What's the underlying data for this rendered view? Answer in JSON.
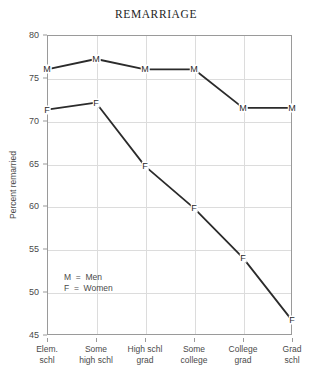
{
  "chart_data": {
    "type": "line",
    "title": "REMARRIAGE",
    "xlabel": "",
    "ylabel": "Percent remarried",
    "ylim": [
      45,
      80
    ],
    "yticks": [
      45,
      50,
      55,
      60,
      65,
      70,
      75,
      80
    ],
    "ytick_labels": [
      "45",
      "50",
      "55",
      "60",
      "65",
      "70",
      "75",
      "80"
    ],
    "grid": true,
    "legend_position": "inside-lower-left",
    "categories": [
      "Elem. schl",
      "Some high schl",
      "High schl grad",
      "Some college",
      "College grad",
      "Grad schl"
    ],
    "category_lines": [
      [
        "Elem.",
        "schl"
      ],
      [
        "Some",
        "high schl"
      ],
      [
        "High schl",
        "grad"
      ],
      [
        "Some",
        "college"
      ],
      [
        "College",
        "grad"
      ],
      [
        "Grad",
        "schl"
      ]
    ],
    "series": [
      {
        "name": "Men",
        "marker": "M",
        "color": "#2b2b2b",
        "values": [
          76.0,
          77.2,
          76.0,
          76.0,
          71.5,
          71.5
        ]
      },
      {
        "name": "Women",
        "marker": "F",
        "color": "#2b2b2b",
        "values": [
          71.3,
          72.1,
          64.7,
          59.8,
          54.0,
          46.7
        ]
      }
    ],
    "legend": [
      {
        "marker": "M",
        "equals": "=",
        "label": "Men"
      },
      {
        "marker": "F",
        "equals": "=",
        "label": "Women"
      }
    ]
  }
}
